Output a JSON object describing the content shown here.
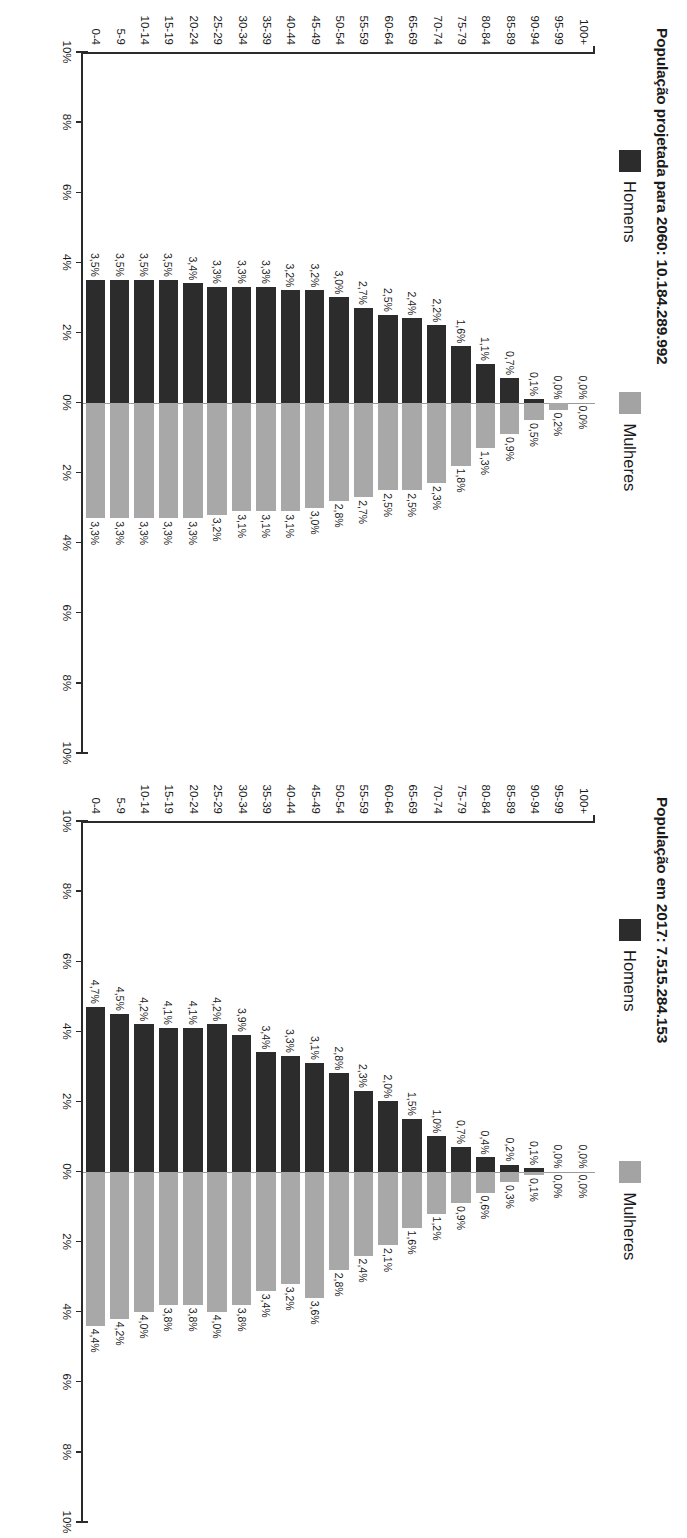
{
  "page": {
    "language": "pt-BR",
    "background": "#ffffff",
    "orientation_note": "scanned page rotated 90 degrees"
  },
  "colors": {
    "men": "#2c2c2c",
    "women": "#a8a8a8",
    "axis": "#2b2b2b",
    "zero_line": "#9a9a9a"
  },
  "axis": {
    "ticks": [
      "10%",
      "8%",
      "6%",
      "4%",
      "2%",
      "0%",
      "2%",
      "4%",
      "6%",
      "8%",
      "10%"
    ],
    "min": -10,
    "max": 10
  },
  "legend": {
    "men_label": "Homens",
    "women_label": "Mulheres"
  },
  "charts": [
    {
      "id": "pop-2060",
      "title": "População projetada para 2060: 10.184.289.992"
    },
    {
      "id": "pop-2017",
      "title": "População em 2017: 7.515.284.153"
    }
  ],
  "chart_data": [
    {
      "type": "bar",
      "subtype": "population-pyramid",
      "title": "População projetada para 2060: 10.184.289.992",
      "xlabel": "",
      "ylabel": "",
      "xlim": [
        -10,
        10
      ],
      "xticks": [
        "10%",
        "8%",
        "6%",
        "4%",
        "2%",
        "0%",
        "2%",
        "4%",
        "6%",
        "8%",
        "10%"
      ],
      "grid": false,
      "legend_position": "top",
      "categories": [
        "100+",
        "95-99",
        "90-94",
        "85-89",
        "80-84",
        "75-79",
        "70-74",
        "65-69",
        "60-64",
        "55-59",
        "50-54",
        "45-49",
        "40-44",
        "35-39",
        "30-34",
        "25-29",
        "20-24",
        "15-19",
        "10-14",
        "5-9",
        "0-4"
      ],
      "series": [
        {
          "name": "Homens",
          "side": "left",
          "values": [
            0.0,
            0.0,
            0.1,
            0.7,
            1.1,
            1.6,
            2.2,
            2.4,
            2.5,
            2.7,
            3.0,
            3.2,
            3.2,
            3.3,
            3.3,
            3.3,
            3.4,
            3.5,
            3.5,
            3.5,
            3.5
          ],
          "labels": [
            "0,0%",
            "0,0%",
            "0,1%",
            "0,7%",
            "1,1%",
            "1,6%",
            "2,2%",
            "2,4%",
            "2,5%",
            "2,7%",
            "3,0%",
            "3,2%",
            "3,2%",
            "3,3%",
            "3,3%",
            "3,3%",
            "3,4%",
            "3,5%",
            "3,5%",
            "3,5%",
            "3,5%"
          ]
        },
        {
          "name": "Mulheres",
          "side": "right",
          "values": [
            0.0,
            0.2,
            0.5,
            0.9,
            1.3,
            1.8,
            2.3,
            2.5,
            2.5,
            2.7,
            2.8,
            3.0,
            3.1,
            3.1,
            3.1,
            3.2,
            3.3,
            3.3,
            3.3,
            3.3,
            3.3
          ],
          "labels": [
            "0,0%",
            "0,2%",
            "0,5%",
            "0,9%",
            "1,3%",
            "1,8%",
            "2,3%",
            "2,5%",
            "2,5%",
            "2,7%",
            "2,8%",
            "3,0%",
            "3,1%",
            "3,1%",
            "3,1%",
            "3,2%",
            "3,3%",
            "3,3%",
            "3,3%",
            "3,3%",
            "3,3%"
          ]
        }
      ]
    },
    {
      "type": "bar",
      "subtype": "population-pyramid",
      "title": "População em 2017: 7.515.284.153",
      "xlabel": "",
      "ylabel": "",
      "xlim": [
        -10,
        10
      ],
      "xticks": [
        "10%",
        "8%",
        "6%",
        "4%",
        "2%",
        "0%",
        "2%",
        "4%",
        "6%",
        "8%",
        "10%"
      ],
      "grid": false,
      "legend_position": "top",
      "categories": [
        "100+",
        "95-99",
        "90-94",
        "85-89",
        "80-84",
        "75-79",
        "70-74",
        "65-69",
        "60-64",
        "55-59",
        "50-54",
        "45-49",
        "40-44",
        "35-39",
        "30-34",
        "25-29",
        "20-24",
        "15-19",
        "10-14",
        "5-9",
        "0-4"
      ],
      "series": [
        {
          "name": "Homens",
          "side": "left",
          "values": [
            0.0,
            0.0,
            0.1,
            0.2,
            0.4,
            0.7,
            1.0,
            1.5,
            2.0,
            2.3,
            2.8,
            3.1,
            3.3,
            3.4,
            3.9,
            4.2,
            4.1,
            4.1,
            4.2,
            4.5,
            4.7
          ],
          "labels": [
            "0,0%",
            "0,0%",
            "0,1%",
            "0,2%",
            "0,4%",
            "0,7%",
            "1,0%",
            "1,5%",
            "2,0%",
            "2,3%",
            "2,8%",
            "3,1%",
            "3,3%",
            "3,4%",
            "3,9%",
            "4,2%",
            "4,1%",
            "4,1%",
            "4,2%",
            "4,5%",
            "4,7%"
          ]
        },
        {
          "name": "Mulheres",
          "side": "right",
          "values": [
            0.0,
            0.0,
            0.1,
            0.3,
            0.6,
            0.9,
            1.2,
            1.6,
            2.1,
            2.4,
            2.8,
            3.6,
            3.2,
            3.4,
            3.8,
            4.0,
            3.8,
            3.8,
            4.0,
            4.2,
            4.4
          ],
          "labels": [
            "0,0%",
            "0,0%",
            "0,1%",
            "0,3%",
            "0,6%",
            "0,9%",
            "1,2%",
            "1,6%",
            "2,1%",
            "2,4%",
            "2,8%",
            "3,6%",
            "3,2%",
            "3,4%",
            "3,8%",
            "4,0%",
            "3,8%",
            "3,8%",
            "4,0%",
            "4,2%",
            "4,4%"
          ]
        }
      ]
    }
  ]
}
